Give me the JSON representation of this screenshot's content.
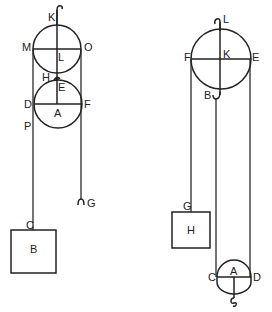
{
  "figure": {
    "colors": {
      "line": "#222222",
      "background": "#ffffff"
    },
    "left_system": {
      "top_pulley": {
        "hook_label": "K",
        "center_label": "L",
        "left_label": "M",
        "right_label": "O"
      },
      "bottom_pulley": {
        "hook_label": "H",
        "top_label": "E",
        "center_label": "A",
        "left_label": "D",
        "right_label": "F"
      },
      "rope_point_label": "P",
      "free_end_hook_label": "G",
      "weight": {
        "attach_label": "C",
        "label": "B"
      }
    },
    "right_system": {
      "top_pulley": {
        "hook_label": "L",
        "center_label": "K",
        "left_label": "F",
        "right_label": "E",
        "bottom_hook_label": "B"
      },
      "weight": {
        "attach_label": "G",
        "label": "H"
      },
      "bottom_pulley": {
        "center_label": "A",
        "left_label": "C",
        "right_label": "D"
      }
    }
  }
}
